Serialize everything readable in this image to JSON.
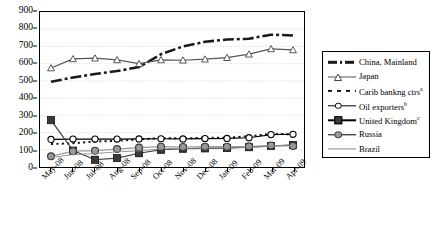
{
  "chart_data": {
    "type": "line",
    "title": "",
    "xlabel": "",
    "ylabel": "",
    "ylim": [
      0,
      900
    ],
    "ytick_step": 100,
    "grid": true,
    "legend_position": "right",
    "categories": [
      "May-08",
      "Jun-08",
      "Jul-08",
      "Aug-08",
      "Sep-08",
      "Oct-08",
      "Nov-08",
      "Dec-08",
      "Jan-09",
      "Feb-09",
      "Mar-09",
      "Apr-09"
    ],
    "yticks": [
      "0",
      "100",
      "200",
      "300",
      "400",
      "500",
      "600",
      "700",
      "800",
      "900"
    ],
    "series": [
      {
        "name": "China, Mainland",
        "marker": "none",
        "style": "dash-dot",
        "color": "#1a1a1a",
        "values": [
          495,
          520,
          540,
          557,
          580,
          655,
          700,
          727,
          740,
          745,
          768,
          764
        ]
      },
      {
        "name": "Japan",
        "marker": "triangle",
        "style": "solid",
        "color": "#555555",
        "values": [
          575,
          628,
          632,
          622,
          600,
          622,
          620,
          626,
          635,
          655,
          686,
          680
        ]
      },
      {
        "name": "Carib bankng ctrs",
        "marker": "none",
        "style": "dotted",
        "color": "#1a1a1a",
        "footnote": "a",
        "values": [
          133,
          138,
          148,
          152,
          160,
          168,
          166,
          170,
          170,
          179,
          192,
          190
        ]
      },
      {
        "name": "Oil exporters",
        "marker": "circle-open",
        "style": "solid",
        "color": "#000000",
        "footnote": "b",
        "values": [
          160,
          162,
          162,
          162,
          163,
          164,
          163,
          165,
          166,
          170,
          188,
          190
        ]
      },
      {
        "name": "United Kingdom",
        "marker": "square-dark",
        "style": "solid",
        "color": "#3a3a3a",
        "footnote": "c",
        "values": [
          272,
          95,
          42,
          52,
          80,
          100,
          106,
          108,
          110,
          115,
          122,
          128
        ]
      },
      {
        "name": "Russia",
        "marker": "circle-grey",
        "style": "solid",
        "color": "#9a9a9a",
        "values": [
          62,
          92,
          95,
          104,
          113,
          118,
          116,
          118,
          118,
          120,
          125,
          122
        ]
      },
      {
        "name": "Brazil",
        "marker": "none",
        "style": "solid-thin",
        "color": "#8a8a8a",
        "values": [
          55,
          72,
          78,
          88,
          94,
          105,
          108,
          110,
          112,
          114,
          120,
          125
        ]
      }
    ]
  }
}
